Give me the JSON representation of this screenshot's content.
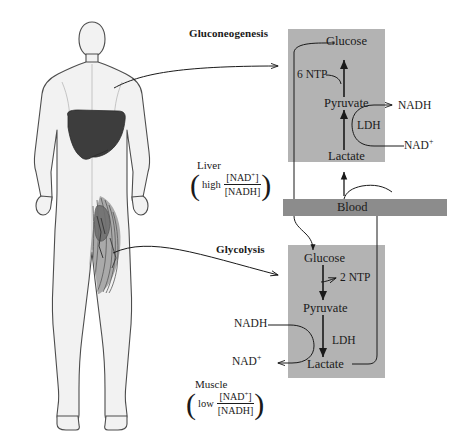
{
  "figure": {
    "colors": {
      "panel_fill": "#b3b3b3",
      "blood_fill": "#8c8c8c",
      "body_fill": "#f2f2f2",
      "body_stroke": "#4d4d4d",
      "liver_fill": "#3d3d3d",
      "muscle_fill": "#8a8a8a",
      "line": "#1a1a1a"
    }
  },
  "body_figure": {
    "name": "human-body-silhouette",
    "liver_label": "liver",
    "muscle_label": "leg muscle"
  },
  "headings": {
    "gluconeogenesis": "Gluconeogenesis",
    "glycolysis": "Glycolysis"
  },
  "blood": {
    "label": "Blood"
  },
  "liver_panel": {
    "glucose": "Glucose",
    "pyruvate": "Pyruvate",
    "lactate": "Lactate",
    "ntp": "6 NTP",
    "enzyme": "LDH",
    "nadh": "NADH",
    "nad_plus": "NAD",
    "nad_plus_sup": "+"
  },
  "muscle_panel": {
    "glucose": "Glucose",
    "pyruvate": "Pyruvate",
    "lactate": "Lactate",
    "ntp": "2 NTP",
    "enzyme": "LDH",
    "nadh": "NADH",
    "nad_plus": "NAD",
    "nad_plus_sup": "+"
  },
  "liver_annotation": {
    "organ": "Liver",
    "qualifier": "high",
    "numerator": "[NAD",
    "numerator_sup": "+",
    "numerator_end": "]",
    "denominator": "[NADH]"
  },
  "muscle_annotation": {
    "organ": "Muscle",
    "qualifier": "low",
    "numerator": "[NAD",
    "numerator_sup": "+",
    "numerator_end": "]",
    "denominator": "[NADH]"
  }
}
